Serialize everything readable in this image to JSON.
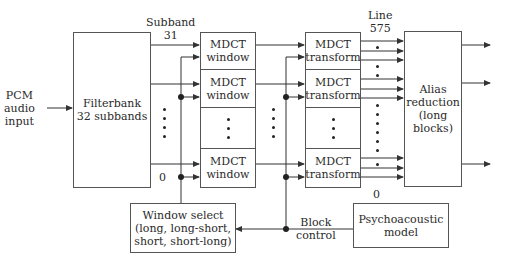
{
  "diagram": {
    "input_label": "PCM\naudio\ninput",
    "filterbank": "Filterbank\n32 subbands",
    "subband_top_label": "Subband\n31",
    "subband_bottom_label": "0",
    "mdct_window": [
      "MDCT\nwindow",
      "MDCT\nwindow",
      "MDCT\nwindow"
    ],
    "mdct_transform": [
      "MDCT\ntransform",
      "MDCT\ntransform",
      "MDCT\ntransform"
    ],
    "line_top_label": "Line\n575",
    "line_bottom_label": "0",
    "alias_reduction": "Alias\nreduction\n(long\nblocks)",
    "window_select": "Window select\n(long, long-short,\nshort, short-long)",
    "block_control_label": "Block\ncontrol",
    "psychoacoustic": "Psychoacoustic\nmodel"
  },
  "colors": {
    "line": "#333333",
    "box_border": "#555555"
  }
}
